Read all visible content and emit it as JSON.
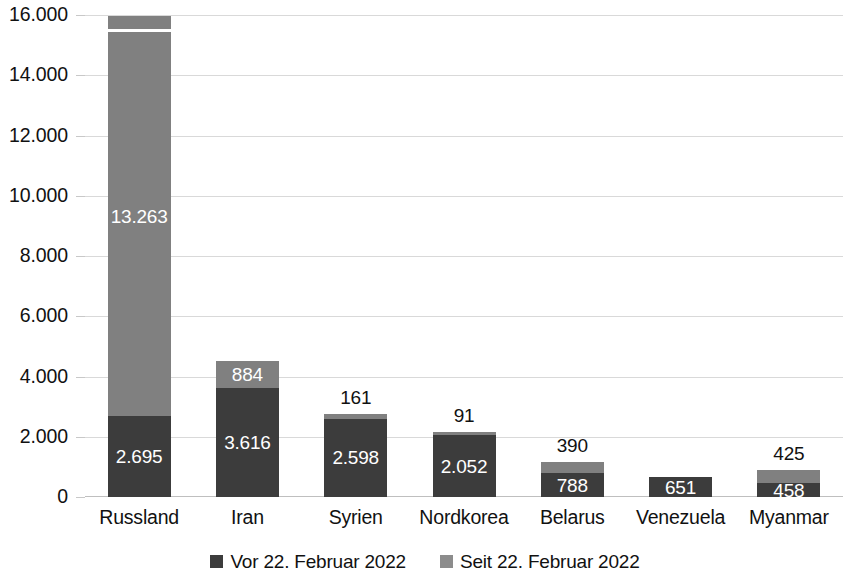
{
  "chart_data": {
    "type": "bar",
    "stacked": true,
    "title": "",
    "subtitle": "",
    "xlabel": "",
    "ylabel": "",
    "ylim": [
      0,
      16000
    ],
    "grid": true,
    "legend_position": "bottom",
    "y_tick_labels": [
      "0",
      "2.000",
      "4.000",
      "6.000",
      "8.000",
      "10.000",
      "12.000",
      "14.000",
      "16.000"
    ],
    "y_tick_values": [
      0,
      2000,
      4000,
      6000,
      8000,
      10000,
      12000,
      14000,
      16000
    ],
    "categories": [
      "Russland",
      "Iran",
      "Syrien",
      "Nordkorea",
      "Belarus",
      "Venezuela",
      "Myanmar"
    ],
    "series": [
      {
        "name": "Vor 22. Februar 2022",
        "color": "#3c3c3c",
        "values": [
          2695,
          3616,
          2598,
          2052,
          788,
          651,
          458
        ],
        "labels": [
          "2.695",
          "3.616",
          "2.598",
          "2.052",
          "788",
          "651",
          "458"
        ]
      },
      {
        "name": "Seit 22. Februar 2022",
        "color": "#808080",
        "values": [
          13263,
          884,
          161,
          91,
          390,
          0,
          425
        ],
        "labels": [
          "13.263",
          "884",
          "161",
          "91",
          "390",
          "",
          "425"
        ]
      }
    ],
    "totals": [
      15958,
      4500,
      2759,
      2143,
      1178,
      651,
      883
    ],
    "axis_break_on_first_bar": true
  },
  "legend": {
    "items": [
      {
        "label": "Vor 22. Februar 2022",
        "swatch": "dark"
      },
      {
        "label": "Seit 22. Februar 2022",
        "swatch": "light"
      }
    ]
  }
}
